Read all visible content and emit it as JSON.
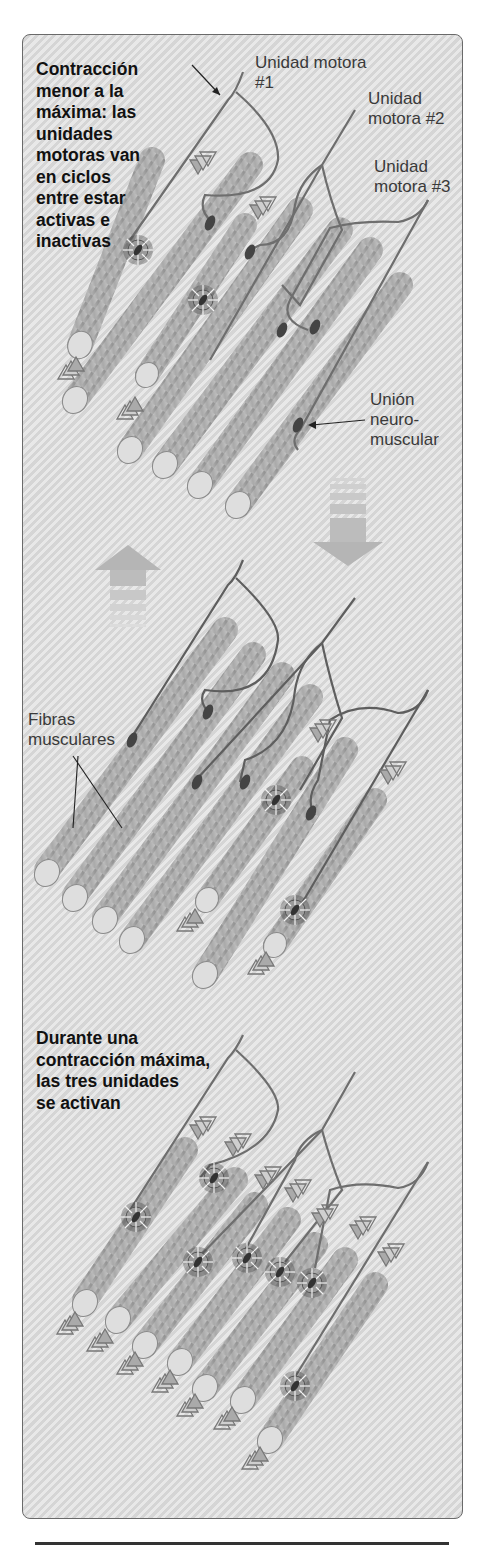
{
  "figure": {
    "top_panel": {
      "caption_lines": [
        "Contracción",
        "menor a la",
        "máxima: las",
        "unidades",
        "motoras van",
        "en ciclos",
        "entre estar",
        "activas e",
        "inactivas"
      ],
      "labels": {
        "motor_unit_1": [
          "Unidad motora",
          "#1"
        ],
        "motor_unit_2": [
          "Unidad",
          "motora #2"
        ],
        "motor_unit_3": [
          "Unidad",
          "motora #3"
        ],
        "neuromuscular_junction": [
          "Unión",
          "neuro-",
          "muscular"
        ]
      }
    },
    "middle_panel": {
      "labels": {
        "muscle_fibers": [
          "Fibras",
          "musculares"
        ]
      }
    },
    "bottom_panel": {
      "caption_lines": [
        "Durante una",
        "contracción máxima,",
        "las tres unidades",
        "se activan"
      ]
    },
    "icons": [
      "up-arrow-icon",
      "down-arrow-icon",
      "activation-burst-icon",
      "signal-chevron-icon",
      "neuromuscular-junction-icon"
    ],
    "colors": {
      "background": "#dcdcdc",
      "fiber": "#b8b8b8",
      "nerve": "#707070",
      "text": "#111111"
    }
  }
}
